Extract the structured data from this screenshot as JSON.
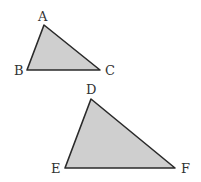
{
  "triangles": [
    {
      "name": "ABC",
      "vertices": [
        "A",
        "B",
        "C"
      ],
      "fill": "#cfcfcf",
      "stroke": "#2a2a2a"
    },
    {
      "name": "DEF",
      "vertices": [
        "D",
        "E",
        "F"
      ],
      "fill": "#cfcfcf",
      "stroke": "#2a2a2a"
    }
  ],
  "labels": {
    "A": "A",
    "B": "B",
    "C": "C",
    "D": "D",
    "E": "E",
    "F": "F"
  }
}
